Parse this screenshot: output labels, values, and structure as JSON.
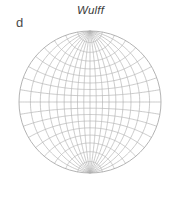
{
  "figure": {
    "panel_label": "d",
    "background_color": "#ffffff"
  },
  "net": {
    "title": "Wulff",
    "title_style": "italic",
    "title_color": "#3b3b3b",
    "type": "wulff-stereographic-net",
    "line_color": "#b4b4b4",
    "boundary_color": "#aaaaaa",
    "center_x": 90,
    "center_y": 102,
    "radius": 71,
    "grid_spacing_degrees": 10,
    "meridian_count": 17,
    "parallel_count": 17,
    "meridian_longitudes": [
      -80,
      -70,
      -60,
      -50,
      -40,
      -30,
      -20,
      -10,
      0,
      10,
      20,
      30,
      40,
      50,
      60,
      70,
      80
    ],
    "parallel_latitudes": [
      -80,
      -70,
      -60,
      -50,
      -40,
      -30,
      -20,
      -10,
      0,
      10,
      20,
      30,
      40,
      50,
      60,
      70,
      80
    ],
    "line_width": 0.7,
    "boundary_line_width": 0.9
  }
}
